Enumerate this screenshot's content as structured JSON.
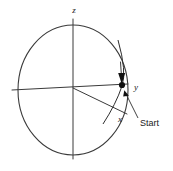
{
  "figure": {
    "title": "",
    "background_color": "#ffffff",
    "line_color": "#3a3a3a",
    "marker_color": "#111111"
  },
  "axes": {
    "z": {
      "label": "z",
      "label_x": 74,
      "label_y": 13,
      "line": {
        "x1": 73,
        "y1": 19,
        "x2": 73,
        "y2": 159
      }
    },
    "y": {
      "label": "y",
      "label_x": 134,
      "label_y": 90,
      "line": {
        "x1": 12,
        "y1": 90,
        "x2": 128,
        "y2": 84
      }
    },
    "x": {
      "label": "x",
      "label_x": 120,
      "label_y": 122,
      "line": {
        "x1": 73,
        "y1": 88,
        "x2": 127,
        "y2": 114
      }
    }
  },
  "orbit": {
    "name": "main-circle",
    "center_x": 73,
    "center_y": 90,
    "radius_x": 55,
    "radius_y": 65
  },
  "inclined_arc": {
    "name": "inclined-orbit-arc",
    "path": "M 118 40 Q 127 72 122 86 Q 116 104 103 124"
  },
  "marker": {
    "name": "start-marker",
    "x": 122,
    "y": 85,
    "radius": 3.1,
    "direction_arrow": {
      "from_x": 121,
      "from_y": 62,
      "to_x": 122,
      "to_y": 82
    }
  },
  "annotations": {
    "start": {
      "label": "Start",
      "label_x": 140,
      "label_y": 125,
      "pointer": {
        "x1": 137,
        "y1": 118,
        "x2": 124,
        "y2": 92
      }
    }
  }
}
